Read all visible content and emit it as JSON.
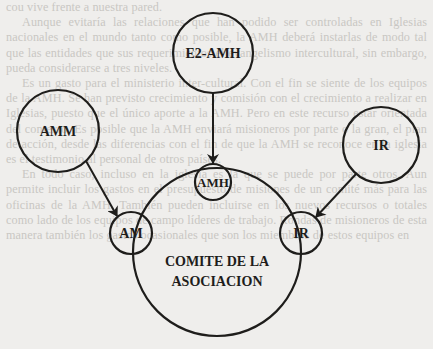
{
  "diagram": {
    "title": "",
    "nodes": [
      {
        "id": "e2-amh",
        "label": "E2-AMH",
        "cx": 213,
        "cy": 53,
        "r": 40,
        "font_size": 14
      },
      {
        "id": "amm",
        "label": "AMM",
        "cx": 58,
        "cy": 131,
        "r": 41,
        "font_size": 14
      },
      {
        "id": "ir-outer",
        "label": "IR",
        "cx": 381,
        "cy": 145,
        "r": 38,
        "font_size": 14
      },
      {
        "id": "amh",
        "label": "AMH",
        "cx": 213,
        "cy": 182,
        "r": 18,
        "font_size": 13
      },
      {
        "id": "am",
        "label": "AM",
        "cx": 131,
        "cy": 233,
        "r": 21,
        "font_size": 14
      },
      {
        "id": "ir-inner",
        "label": "IR",
        "cx": 301,
        "cy": 233,
        "r": 21,
        "font_size": 14
      },
      {
        "id": "comite",
        "label_lines": [
          "COMITE DE LA",
          "ASOCIACION"
        ],
        "cx": 217,
        "cy": 252,
        "r": 84,
        "font_size": 14
      }
    ],
    "edges": [
      {
        "from": "e2-amh",
        "to": "amh",
        "type": "arrow"
      },
      {
        "from": "amm",
        "to": "am",
        "type": "arrow"
      },
      {
        "from": "ir-outer",
        "to": "ir-inner",
        "type": "arrow"
      }
    ],
    "colors": {
      "stroke": "#1e1d1b",
      "text": "#1e1d1b",
      "paper": "#efeeec",
      "bleed_text": "#c9c7c3"
    }
  },
  "bleed_through_text": {
    "paragraphs": [
      "cou vive frente a nuestra pared.",
      "Aunque evitaría las relaciones que han podido ser controladas en Iglesias nacionales en el mundo tanto como posible, la AMH deberá instarlas de modo tal que las entidades que sus requerimientos el evangelismo intercultural, sin embargo, pueda considerarse a tres niveles.",
      "Es un gasto para el ministerio inter-cultural. Con el fin se siente de los equipos de la AMH. Se han previsto crecimiento y comisión con el crecimiento a realizar en Iglesias, puesto que el único aporte a la AMH. Pero en este recurso estar orientada del contexto. Es posible que la AMH enviará misioneros por parte o la gran, el plan de acción, desde las diferencias con el fin de que la AMH se reconoce en la iglesia es el testimonio al personal de otros países.",
      "En todo caso, incluso en la iglesia es la que se puede por parte otros. Aun permite incluir los gastos en el presupuesto de misiones de un comité más para las oficinas de la AMH. También pueden incluirse en los nuevos recursos o totales como lado de los equipos de campo líderes de trabajo. Rondas de misioneros de esta manera también los gastos ocasionales que son los miembros de estos equipos en"
    ]
  }
}
